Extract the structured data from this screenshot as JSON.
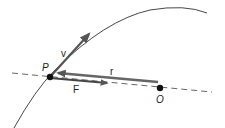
{
  "diagram": {
    "type": "orbital-force-diagram",
    "points": {
      "P": {
        "label": "P",
        "x": 50,
        "y": 77
      },
      "O": {
        "label": "O",
        "x": 160,
        "y": 88
      }
    },
    "vectors": {
      "v": {
        "label": "v",
        "from": "P",
        "color": "#555555"
      },
      "r": {
        "label": "r",
        "to": "P",
        "from_near": "O",
        "color": "#666666"
      },
      "F": {
        "label": "F",
        "from": "P",
        "toward": "O",
        "color": "#444444"
      }
    },
    "curve": {
      "description": "trajectory",
      "color": "#333333"
    },
    "line": {
      "description": "dashed line through P and O",
      "style": "dashed",
      "color": "#555555"
    }
  }
}
